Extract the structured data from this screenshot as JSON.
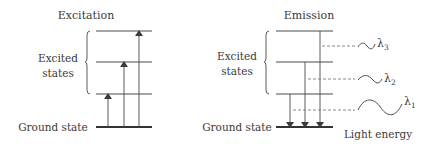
{
  "colors": {
    "line": "#4a4a4a",
    "dashed": "#7a7a7a",
    "text": "#3a3a3a",
    "background": "#ffffff"
  },
  "excitation": {
    "title": "Excitation",
    "excited_label_line1": "Excited",
    "excited_label_line2": "states",
    "ground_label": "Ground state",
    "levels": [
      "excited-3",
      "excited-2",
      "excited-1",
      "ground"
    ],
    "arrows": [
      {
        "from": "ground",
        "to": "excited-1",
        "direction": "up"
      },
      {
        "from": "ground",
        "to": "excited-2",
        "direction": "up"
      },
      {
        "from": "ground",
        "to": "excited-3",
        "direction": "up"
      }
    ]
  },
  "emission": {
    "title": "Emission",
    "excited_label_line1": "Excited",
    "excited_label_line2": "states",
    "ground_label": "Ground state",
    "light_energy_label": "Light energy",
    "arrows": [
      {
        "from": "excited-1",
        "to": "ground",
        "direction": "down"
      },
      {
        "from": "excited-2",
        "to": "ground",
        "direction": "down"
      },
      {
        "from": "excited-3",
        "to": "ground",
        "direction": "down"
      }
    ],
    "wavelengths": [
      {
        "symbol": "λ",
        "subscript": "3"
      },
      {
        "symbol": "λ",
        "subscript": "2"
      },
      {
        "symbol": "λ",
        "subscript": "1"
      }
    ]
  }
}
